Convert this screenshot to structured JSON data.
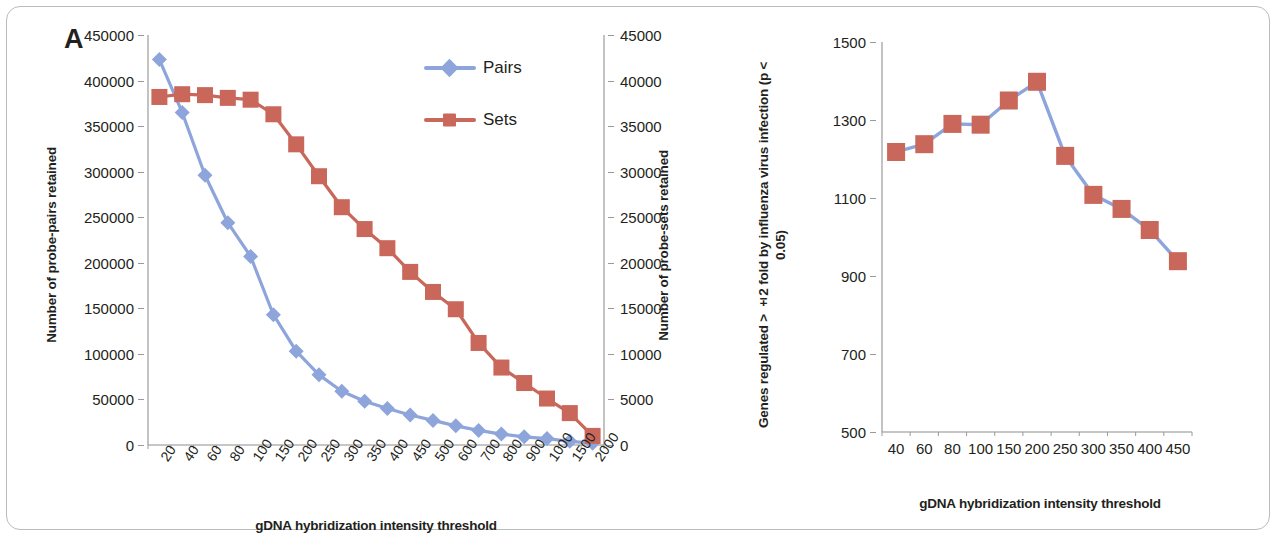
{
  "figure": {
    "panel_a_letter": "A",
    "panel_b_letter": "B"
  },
  "panelA": {
    "ylabel_left": "Number  of probe-pairs retained",
    "ylabel_right": "Number of probe-sets retained",
    "xtitle": "gDNA hybridization intensity threshold",
    "legend": [
      {
        "label": "Pairs",
        "color": "#8DA5DB",
        "marker": "diamond"
      },
      {
        "label": "Sets",
        "color": "#C8675A",
        "marker": "square"
      }
    ]
  },
  "panelB": {
    "ylabel": "Genes regulated > ±2 fold by influenza virus  infection (p < 0.05)",
    "xtitle": "gDNA hybridization  intensity threshold"
  },
  "chart_data": [
    {
      "type": "line",
      "panel": "A",
      "title": "",
      "xlabel": "gDNA hybridization intensity threshold",
      "ylabel": "Number  of probe-pairs retained",
      "y2label": "Number of probe-sets retained",
      "categories": [
        "20",
        "40",
        "60",
        "80",
        "100",
        "150",
        "200",
        "250",
        "300",
        "350",
        "400",
        "450",
        "500",
        "600",
        "700",
        "800",
        "900",
        "1000",
        "1500",
        "2000"
      ],
      "ylim": [
        0,
        450000
      ],
      "ytick_step": 50000,
      "yticks": [
        0,
        50000,
        100000,
        150000,
        200000,
        250000,
        300000,
        350000,
        400000,
        450000
      ],
      "y2lim": [
        0,
        45000
      ],
      "y2tick_step": 5000,
      "y2ticks": [
        0,
        5000,
        10000,
        15000,
        20000,
        25000,
        30000,
        35000,
        40000,
        45000
      ],
      "grid": false,
      "legend_position": "inside-top-right",
      "series": [
        {
          "name": "Pairs",
          "axis": "left",
          "color": "#8DA5DB",
          "marker": "diamond",
          "values": [
            423000,
            365000,
            296000,
            244000,
            207000,
            143000,
            103000,
            77000,
            59000,
            48000,
            40000,
            33000,
            27000,
            21000,
            16000,
            12000,
            9000,
            7000,
            4000,
            2000
          ]
        },
        {
          "name": "Sets",
          "axis": "right",
          "color": "#C8675A",
          "marker": "square",
          "values": [
            38200,
            38500,
            38400,
            38100,
            37900,
            36300,
            33000,
            29500,
            26100,
            23700,
            21600,
            19000,
            16800,
            14900,
            11200,
            8500,
            6800,
            5100,
            3500,
            1000
          ]
        }
      ]
    },
    {
      "type": "line",
      "panel": "B",
      "title": "",
      "xlabel": "gDNA hybridization  intensity threshold",
      "ylabel": "Genes regulated > ±2 fold by influenza virus  infection (p < 0.05)",
      "categories": [
        "40",
        "60",
        "80",
        "100",
        "150",
        "200",
        "250",
        "300",
        "350",
        "400",
        "450"
      ],
      "ylim": [
        500,
        1500
      ],
      "ytick_step": 200,
      "yticks": [
        500,
        700,
        900,
        1100,
        1300,
        1500
      ],
      "grid": false,
      "series": [
        {
          "name": "Genes regulated",
          "color": "#C8675A",
          "line_color": "#8DA5DB",
          "marker": "square",
          "values": [
            1218,
            1238,
            1290,
            1288,
            1350,
            1398,
            1208,
            1108,
            1072,
            1018,
            938
          ]
        }
      ]
    }
  ]
}
